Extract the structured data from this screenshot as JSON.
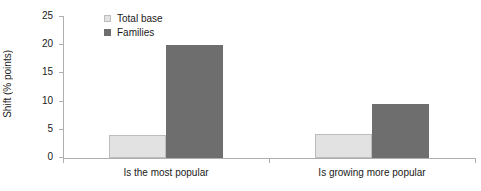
{
  "chart_data": {
    "type": "bar",
    "title": "",
    "xlabel": "",
    "ylabel": "Shift (% points)",
    "categories": [
      "Is the most popular",
      "Is growing more popular"
    ],
    "series": [
      {
        "name": "Total base",
        "color": "#e2e2e2",
        "values": [
          4.0,
          4.3
        ]
      },
      {
        "name": "Families",
        "color": "#6e6e6e",
        "values": [
          20.0,
          9.5
        ]
      }
    ],
    "ylim": [
      0,
      25
    ],
    "yticks": [
      0,
      5,
      10,
      15,
      20,
      25
    ],
    "ytick_labels": [
      "0",
      "5",
      "10",
      "15",
      "20",
      "25"
    ],
    "grid": false,
    "legend_position": "top-left-inside"
  }
}
